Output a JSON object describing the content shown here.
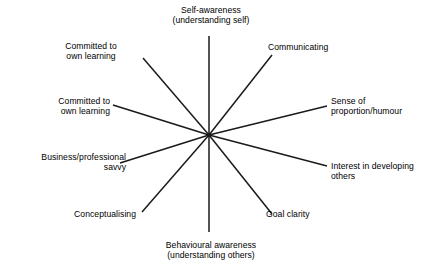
{
  "diagram": {
    "type": "radial-spoke",
    "title": "",
    "background_color": "#ffffff",
    "line_color": "#1a1a1a",
    "text_color": "#000000",
    "center": {
      "x": 209,
      "y": 135
    },
    "spoke_count": 8,
    "spokes": [
      {
        "id": "self-awareness",
        "label": "Self-awareness\n(understanding self)",
        "direction": "up",
        "angle_deg": 90,
        "end": {
          "x": 209,
          "y": 36
        }
      },
      {
        "id": "communicating",
        "label": "Communicating",
        "direction": "upper-right",
        "angle_deg": 52,
        "end": {
          "x": 272,
          "y": 55
        }
      },
      {
        "id": "sense-of-proportion-humour",
        "label": "Sense of\nproportion/humour",
        "direction": "right-upper",
        "angle_deg": 14,
        "end": {
          "x": 327,
          "y": 106
        }
      },
      {
        "id": "interest-in-developing-others",
        "label": "Interest in developing\nothers",
        "direction": "right-lower",
        "angle_deg": -14,
        "end": {
          "x": 327,
          "y": 166
        }
      },
      {
        "id": "goal-clarity",
        "label": "Goal clarity",
        "direction": "lower-right",
        "angle_deg": -52,
        "end": {
          "x": 272,
          "y": 214
        }
      },
      {
        "id": "behavioural-awareness",
        "label": "Behavioural awareness\n(understanding others)",
        "direction": "down",
        "angle_deg": -90,
        "end": {
          "x": 209,
          "y": 232
        }
      },
      {
        "id": "conceptualising",
        "label": "Conceptualising",
        "direction": "lower-left",
        "angle_deg": -128,
        "end": {
          "x": 142,
          "y": 212
        }
      },
      {
        "id": "business-professional-savvy",
        "label": "Business/professional\nsavvy",
        "direction": "left-lower",
        "angle_deg": -166,
        "end": {
          "x": 120,
          "y": 163
        }
      },
      {
        "id": "committed-to-own-learning-left",
        "label": "Committed to\nown learning",
        "direction": "left-upper",
        "angle_deg": 166,
        "end": {
          "x": 113,
          "y": 105
        }
      },
      {
        "id": "committed-to-own-learning-upper",
        "label": "Committed to\nown learning",
        "direction": "upper-left",
        "angle_deg": 128,
        "end": {
          "x": 143,
          "y": 58
        }
      }
    ]
  },
  "labels": {
    "self_awareness": "Self-awareness\n(understanding self)",
    "committed_upper": "Committed to\nown learning",
    "committed_left": "Committed to\nown learning",
    "business_savvy": "Business/professional\nsavvy",
    "conceptualising": "Conceptualising",
    "behavioural_awareness": "Behavioural awareness\n(understanding others)",
    "goal_clarity": "Goal clarity",
    "interest_developing": "Interest in developing\nothers",
    "sense_proportion": "Sense of\nproportion/humour",
    "communicating": "Communicating"
  }
}
